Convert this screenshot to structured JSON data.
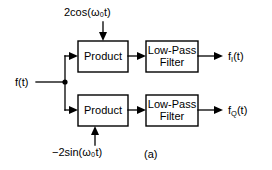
{
  "diagram": {
    "caption": "(a)",
    "input": {
      "label": "f(t)"
    },
    "carriers": {
      "top": "2cos(ω₀t)",
      "bottom": "−2sin(ω₀t)"
    },
    "blocks": {
      "product_top": "Product",
      "product_bottom": "Product",
      "filter_top": "Low-Pass\nFilter",
      "filter_bottom": "Low-Pass\nFilter"
    },
    "outputs": {
      "top_base": "f",
      "top_sub": "I",
      "top_tail": "(t)",
      "bottom_base": "f",
      "bottom_sub": "Q",
      "bottom_tail": "(t)"
    },
    "colors": {
      "line": "#000000",
      "background": "#ffffff",
      "text": "#000000"
    }
  }
}
